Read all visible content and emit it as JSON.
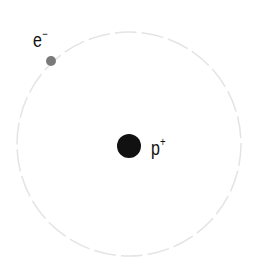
{
  "diagram": {
    "orbit": {
      "cx": 129,
      "cy": 144,
      "r": 112,
      "color": "#e4e4e4",
      "style": "dashed"
    },
    "proton": {
      "cx": 129,
      "cy": 146,
      "r": 12,
      "color": "#111111",
      "label": "p",
      "charge": "+"
    },
    "electron": {
      "cx": 51,
      "cy": 61,
      "r": 5,
      "color": "#7a7a7a",
      "label": "e",
      "charge": "−"
    }
  }
}
